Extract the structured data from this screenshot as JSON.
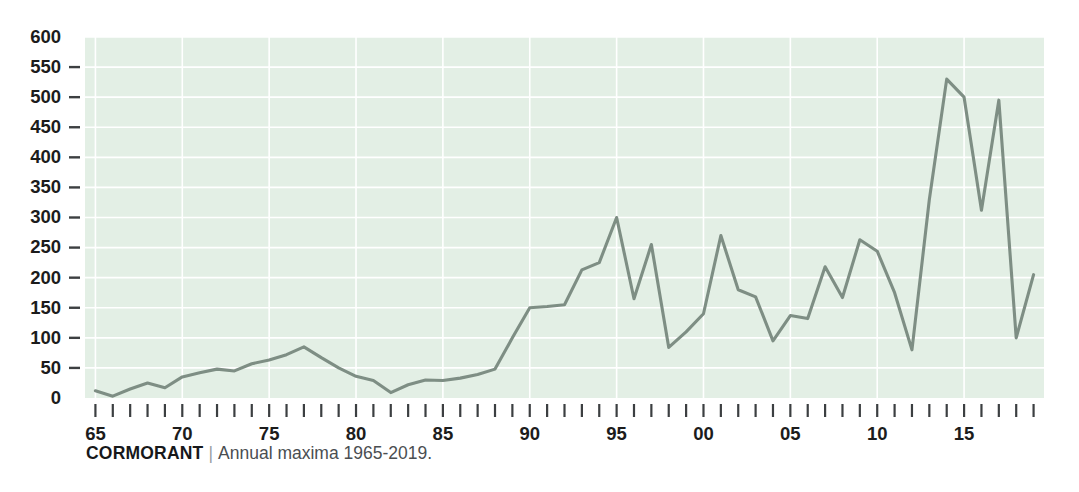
{
  "caption": {
    "title": "CORMORANT",
    "separator": "|",
    "subtitle": "Annual maxima 1965-2019."
  },
  "colors": {
    "plot_background": "#e3efe5",
    "gridline": "#ffffff",
    "series_line": "#7e8e84",
    "tick_mark": "#3c3f41",
    "axis_label": "#1c1c1c",
    "caption_title": "#17181a",
    "caption_subtitle": "#4a4e51",
    "page_background": "#ffffff"
  },
  "chart_data": {
    "type": "line",
    "title": "CORMORANT",
    "subtitle": "Annual maxima 1965-2019.",
    "xlabel": "",
    "ylabel": "",
    "xlim": [
      1964.4,
      2019.6
    ],
    "ylim": [
      0,
      600
    ],
    "grid": true,
    "legend": "none",
    "y_ticks": [
      0,
      50,
      100,
      150,
      200,
      250,
      300,
      350,
      400,
      450,
      500,
      550,
      600
    ],
    "y_tick_labels": [
      "0",
      "50",
      "100",
      "150",
      "200",
      "250",
      "300",
      "350",
      "400",
      "450",
      "500",
      "550",
      "600"
    ],
    "x_tick_years": [
      1965,
      1966,
      1967,
      1968,
      1969,
      1970,
      1971,
      1972,
      1973,
      1974,
      1975,
      1976,
      1977,
      1978,
      1979,
      1980,
      1981,
      1982,
      1983,
      1984,
      1985,
      1986,
      1987,
      1988,
      1989,
      1990,
      1991,
      1992,
      1993,
      1994,
      1995,
      1996,
      1997,
      1998,
      1999,
      2000,
      2001,
      2002,
      2003,
      2004,
      2005,
      2006,
      2007,
      2008,
      2009,
      2010,
      2011,
      2012,
      2013,
      2014,
      2015,
      2016,
      2017,
      2018,
      2019
    ],
    "x_labeled_ticks": [
      {
        "year": 1965,
        "label": "65"
      },
      {
        "year": 1970,
        "label": "70"
      },
      {
        "year": 1975,
        "label": "75"
      },
      {
        "year": 1980,
        "label": "80"
      },
      {
        "year": 1985,
        "label": "85"
      },
      {
        "year": 1990,
        "label": "90"
      },
      {
        "year": 1995,
        "label": "95"
      },
      {
        "year": 2000,
        "label": "00"
      },
      {
        "year": 2005,
        "label": "05"
      },
      {
        "year": 2010,
        "label": "10"
      },
      {
        "year": 2015,
        "label": "15"
      }
    ],
    "series": [
      {
        "name": "Cormorant annual maxima",
        "x": [
          1965,
          1966,
          1967,
          1968,
          1969,
          1970,
          1971,
          1972,
          1973,
          1974,
          1975,
          1976,
          1977,
          1978,
          1979,
          1980,
          1981,
          1982,
          1983,
          1984,
          1985,
          1986,
          1987,
          1988,
          1989,
          1990,
          1991,
          1992,
          1993,
          1994,
          1995,
          1996,
          1997,
          1998,
          1999,
          2000,
          2001,
          2002,
          2003,
          2004,
          2005,
          2006,
          2007,
          2008,
          2009,
          2010,
          2011,
          2012,
          2013,
          2014,
          2015,
          2016,
          2017,
          2018,
          2019
        ],
        "values": [
          12,
          3,
          15,
          25,
          17,
          35,
          42,
          48,
          45,
          57,
          63,
          72,
          85,
          67,
          50,
          36,
          29,
          9,
          22,
          30,
          29,
          33,
          39,
          48,
          100,
          150,
          152,
          155,
          213,
          225,
          300,
          165,
          255,
          84,
          110,
          140,
          270,
          180,
          168,
          95,
          137,
          132,
          218,
          167,
          263,
          244,
          175,
          80,
          330,
          530,
          500,
          312,
          495,
          100,
          205
        ]
      }
    ]
  },
  "axes_geometry": {
    "plot_left": 85,
    "plot_right": 1044,
    "plot_top": 37,
    "plot_bottom": 398
  }
}
